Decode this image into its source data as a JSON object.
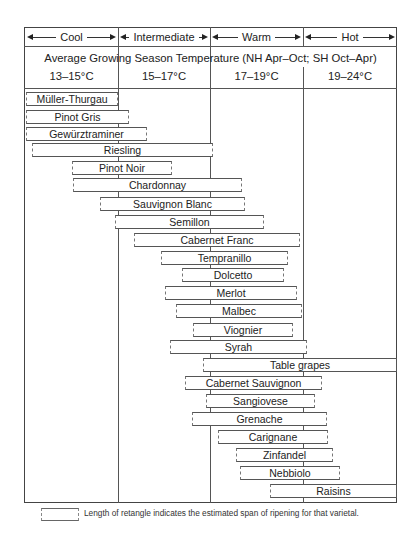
{
  "header": {
    "zones": [
      {
        "label": "Cool",
        "left": 25,
        "width": 93
      },
      {
        "label": "Intermediate",
        "left": 118,
        "width": 92
      },
      {
        "label": "Warm",
        "left": 210,
        "width": 93
      },
      {
        "label": "Hot",
        "left": 303,
        "width": 94
      }
    ],
    "subtitle": "Average Growing Season Temperature (NH Apr–Oct; SH Oct–Apr)",
    "temperature_ranges": [
      "13–15°C",
      "15–17°C",
      "17–19°C",
      "19–24°C"
    ]
  },
  "legend": {
    "text": "Length of retangle indicates the estimated span of ripening for that varietal."
  },
  "chart_data": {
    "type": "range-bar",
    "title": "Average Growing Season Temperature (NH Apr–Oct; SH Oct–Apr)",
    "x_categories": [
      "Cool",
      "Intermediate",
      "Warm",
      "Hot"
    ],
    "x_ranges_celsius": [
      "13–15°C",
      "15–17°C",
      "17–19°C",
      "19–24°C"
    ],
    "xlim_celsius": [
      13,
      24
    ],
    "note": "Length of retangle indicates the estimated span of ripening for that varietal.",
    "varieties": [
      {
        "name": "Müller-Thurgau",
        "min_c": 13.0,
        "max_c": 15.0
      },
      {
        "name": "Pinot Gris",
        "min_c": 13.0,
        "max_c": 15.2
      },
      {
        "name": "Gewürztraminer",
        "min_c": 13.0,
        "max_c": 15.6
      },
      {
        "name": "Riesling",
        "min_c": 13.2,
        "max_c": 17.1
      },
      {
        "name": "Pinot Noir",
        "min_c": 14.0,
        "max_c": 16.3
      },
      {
        "name": "Chardonnay",
        "min_c": 14.1,
        "max_c": 17.7
      },
      {
        "name": "Sauvignon Blanc",
        "min_c": 14.6,
        "max_c": 17.8
      },
      {
        "name": "Semillon",
        "min_c": 15.0,
        "max_c": 18.2
      },
      {
        "name": "Cabernet Franc",
        "min_c": 15.4,
        "max_c": 19.0
      },
      {
        "name": "Tempranillo",
        "min_c": 16.0,
        "max_c": 18.7
      },
      {
        "name": "Dolcetto",
        "min_c": 16.4,
        "max_c": 18.6
      },
      {
        "name": "Merlot",
        "min_c": 16.1,
        "max_c": 18.9
      },
      {
        "name": "Malbec",
        "min_c": 16.3,
        "max_c": 19.0
      },
      {
        "name": "Viognier",
        "min_c": 16.7,
        "max_c": 18.8
      },
      {
        "name": "Syrah",
        "min_c": 16.2,
        "max_c": 19.1
      },
      {
        "name": "Table grapes",
        "min_c": 16.9,
        "max_c": 24.0
      },
      {
        "name": "Cabernet Sauvignon",
        "min_c": 16.6,
        "max_c": 19.4
      },
      {
        "name": "Sangiovese",
        "min_c": 17.0,
        "max_c": 19.3
      },
      {
        "name": "Grenache",
        "min_c": 16.8,
        "max_c": 19.5
      },
      {
        "name": "Carignane",
        "min_c": 17.3,
        "max_c": 19.5
      },
      {
        "name": "Zinfandel",
        "min_c": 17.6,
        "max_c": 19.6
      },
      {
        "name": "Nebbiolo",
        "min_c": 17.7,
        "max_c": 19.8
      },
      {
        "name": "Raisins",
        "min_c": 18.3,
        "max_c": 24.0
      }
    ]
  },
  "bars": [
    {
      "name": "Müller-Thurgau",
      "x": 26,
      "y": 92,
      "w": 92
    },
    {
      "name": "Pinot Gris",
      "x": 26,
      "y": 110,
      "w": 103
    },
    {
      "name": "Gewürztraminer",
      "x": 26,
      "y": 127,
      "w": 121
    },
    {
      "name": "Riesling",
      "x": 32,
      "y": 143,
      "w": 181
    },
    {
      "name": "Pinot Noir",
      "x": 72,
      "y": 161,
      "w": 100
    },
    {
      "name": "Chardonnay",
      "x": 73,
      "y": 178,
      "w": 169
    },
    {
      "name": "Sauvignon Blanc",
      "x": 100,
      "y": 197,
      "w": 145
    },
    {
      "name": "Semillon",
      "x": 115,
      "y": 215,
      "w": 149
    },
    {
      "name": "Cabernet Franc",
      "x": 134,
      "y": 233,
      "w": 166
    },
    {
      "name": "Tempranillo",
      "x": 161,
      "y": 251,
      "w": 127
    },
    {
      "name": "Dolcetto",
      "x": 182,
      "y": 268,
      "w": 102
    },
    {
      "name": "Merlot",
      "x": 165,
      "y": 286,
      "w": 132
    },
    {
      "name": "Malbec",
      "x": 176,
      "y": 304,
      "w": 126
    },
    {
      "name": "Viognier",
      "x": 193,
      "y": 323,
      "w": 100
    },
    {
      "name": "Syrah",
      "x": 170,
      "y": 340,
      "w": 137
    },
    {
      "name": "Table grapes",
      "x": 203,
      "y": 358,
      "w": 194,
      "solid": true
    },
    {
      "name": "Cabernet Sauvignon",
      "x": 185,
      "y": 376,
      "w": 137
    },
    {
      "name": "Sangiovese",
      "x": 206,
      "y": 394,
      "w": 109
    },
    {
      "name": "Grenache",
      "x": 192,
      "y": 412,
      "w": 135
    },
    {
      "name": "Carignane",
      "x": 218,
      "y": 430,
      "w": 110
    },
    {
      "name": "Zinfandel",
      "x": 236,
      "y": 448,
      "w": 97
    },
    {
      "name": "Nebbiolo",
      "x": 240,
      "y": 466,
      "w": 100
    },
    {
      "name": "Raisins",
      "x": 270,
      "y": 484,
      "w": 127,
      "solid": true
    }
  ]
}
